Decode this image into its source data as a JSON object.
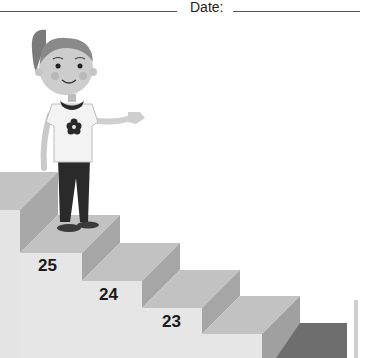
{
  "header": {
    "date_label": "Date:"
  },
  "illustration": {
    "subject": "girl standing on staircase",
    "steps": [
      {
        "label": "25"
      },
      {
        "label": "24"
      },
      {
        "label": "23"
      }
    ]
  }
}
